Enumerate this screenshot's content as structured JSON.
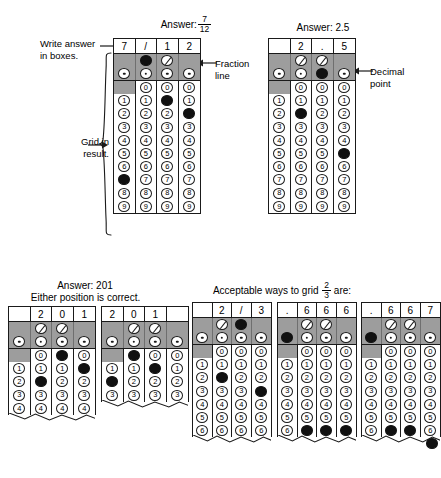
{
  "figure": {
    "annotations": {
      "write_answer": "Write answer\nin boxes.",
      "grid_in_result": "Grid in\nresult.",
      "fraction_line": "Fraction\nline",
      "decimal_point": "Decimal\npoint"
    },
    "captions": {
      "answer_fraction_prefix": "Answer:",
      "answer_fraction_num": "7",
      "answer_fraction_den": "12",
      "answer_decimal": "Answer: 2.5",
      "answer_201_line1": "Answer: 201",
      "answer_201_line2": "Either position is correct.",
      "acceptable_prefix": "Acceptable ways to grid",
      "acceptable_num": "2",
      "acceptable_den": "3",
      "acceptable_suffix": "are:"
    },
    "colors": {
      "grey_band": "#9d9d9d",
      "ink": "#1a1a1a",
      "paper": "#ffffff",
      "filled_bubble": "#111111"
    },
    "digit_labels": [
      "0",
      "1",
      "2",
      "3",
      "4",
      "5",
      "6",
      "7",
      "8",
      "9"
    ],
    "symbols": {
      "slash": "/",
      "dot": "."
    }
  },
  "grids": [
    {
      "id": "grid-7-12",
      "answer_row": [
        "7",
        "/",
        "1",
        "2"
      ],
      "slash_row": [
        false,
        "fill",
        "slash",
        false
      ],
      "dot_row": [
        "dot",
        "dot",
        "dot",
        "dot"
      ],
      "digits_start": 0,
      "digits_end": 9,
      "zero_row_present": [
        false,
        true,
        true,
        true
      ],
      "filled": [
        7,
        null,
        1,
        2
      ],
      "truncated": false
    },
    {
      "id": "grid-2-5",
      "answer_row": [
        "",
        "2",
        ".",
        "5"
      ],
      "slash_row": [
        false,
        "slash",
        "slash",
        false
      ],
      "dot_row": [
        "dot",
        "dot",
        "fill",
        "dot"
      ],
      "digits_start": 0,
      "digits_end": 9,
      "zero_row_present": [
        false,
        true,
        true,
        true
      ],
      "filled": [
        null,
        2,
        null,
        5
      ],
      "truncated": false
    },
    {
      "id": "grid-201-right",
      "answer_row": [
        "",
        "2",
        "0",
        "1"
      ],
      "slash_row": [
        false,
        "slash",
        "slash",
        false
      ],
      "dot_row": [
        "dot",
        "dot",
        "dot",
        "dot"
      ],
      "digits_start": 0,
      "digits_end": 4,
      "zero_row_present": [
        false,
        true,
        true,
        true
      ],
      "filled": [
        null,
        2,
        0,
        1
      ],
      "truncated": true
    },
    {
      "id": "grid-201-left",
      "answer_row": [
        "2",
        "0",
        "1",
        ""
      ],
      "slash_row": [
        false,
        "slash",
        "slash",
        false
      ],
      "dot_row": [
        "dot",
        "dot",
        "dot",
        "dot"
      ],
      "digits_start": 0,
      "digits_end": 3,
      "zero_row_present": [
        false,
        true,
        true,
        true
      ],
      "filled": [
        2,
        0,
        1,
        null
      ],
      "truncated": true
    },
    {
      "id": "grid-2-3-fraction",
      "answer_row": [
        "",
        "2",
        "/",
        "3"
      ],
      "slash_row": [
        false,
        "slash",
        "fill",
        false
      ],
      "dot_row": [
        "dot",
        "dot",
        "dot",
        "dot"
      ],
      "digits_start": 0,
      "digits_end": 6,
      "zero_row_present": [
        false,
        true,
        true,
        true
      ],
      "filled": [
        null,
        2,
        null,
        3
      ],
      "truncated": true
    },
    {
      "id": "grid-666",
      "answer_row": [
        ".",
        "6",
        "6",
        "6"
      ],
      "slash_row": [
        false,
        "slash",
        "slash",
        false
      ],
      "dot_row": [
        "fill",
        "dot",
        "dot",
        "dot"
      ],
      "digits_start": 0,
      "digits_end": 6,
      "zero_row_present": [
        false,
        true,
        true,
        true
      ],
      "filled": [
        null,
        6,
        6,
        6
      ],
      "truncated": true
    },
    {
      "id": "grid-667",
      "answer_row": [
        ".",
        "6",
        "6",
        "7"
      ],
      "slash_row": [
        false,
        "slash",
        "slash",
        false
      ],
      "dot_row": [
        "fill",
        "dot",
        "dot",
        "dot"
      ],
      "digits_start": 0,
      "digits_end": 6,
      "zero_row_present": [
        false,
        true,
        true,
        true
      ],
      "filled": [
        null,
        6,
        6,
        null
      ],
      "truncated": true
    }
  ]
}
